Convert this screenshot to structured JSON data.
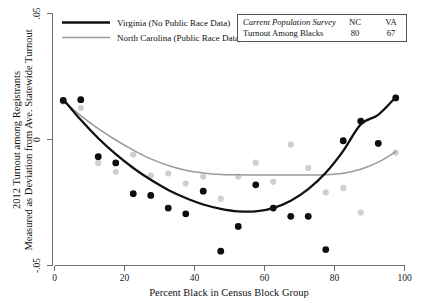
{
  "chart_data": {
    "type": "scatter",
    "title": "",
    "xlabel": "Percent Black in Census Block Group",
    "ylabel_line1": "2012 Turnout among Registrants",
    "ylabel_line2": "Measured as Deviation from Ave. Statewide Turnout",
    "xlim": [
      0,
      100
    ],
    "ylim": [
      -0.05,
      0.05
    ],
    "xticks": [
      0,
      20,
      40,
      60,
      80,
      100
    ],
    "xtick_labels": [
      "0",
      "20",
      "40",
      "60",
      "80",
      "100"
    ],
    "yticks": [
      0.05,
      0,
      -0.05
    ],
    "ytick_labels": [
      ".05",
      "0",
      "-.05"
    ],
    "grid": false,
    "legend_position": "top-left",
    "series": [
      {
        "name": "Virginia (No Public Race Data)",
        "color": "#111111",
        "marker_color": "#0d0d0d",
        "line_width": 2.3,
        "x": [
          2.5,
          7.5,
          12.5,
          17.5,
          22.5,
          27.5,
          32.5,
          37.5,
          42.5,
          47.5,
          52.5,
          57.5,
          62.5,
          67.5,
          72.5,
          77.5,
          82.5,
          87.5,
          92.5,
          97.5
        ],
        "y": [
          0.0155,
          0.0158,
          -0.0068,
          -0.0093,
          -0.0215,
          -0.0222,
          -0.0272,
          -0.0295,
          -0.0205,
          -0.0443,
          -0.0345,
          -0.018,
          -0.0272,
          -0.0305,
          -0.0305,
          -0.0437,
          -0.0005,
          0.0073,
          -0.0015,
          0.0165
        ],
        "fit_x": [
          2.5,
          7.5,
          12.5,
          17.5,
          22.5,
          27.5,
          32.5,
          37.5,
          42.5,
          47.5,
          52.5,
          57.5,
          62.5,
          67.5,
          72.5,
          77.5,
          82.5,
          87.5,
          92.5,
          97.5
        ],
        "fit_y": [
          0.016,
          0.0078,
          0.0005,
          -0.0058,
          -0.0113,
          -0.016,
          -0.02,
          -0.0232,
          -0.0258,
          -0.0275,
          -0.0285,
          -0.0285,
          -0.0272,
          -0.0243,
          -0.0197,
          -0.0132,
          -0.0045,
          0.006,
          0.0098,
          0.0168
        ]
      },
      {
        "name": "North Carolina (Public Race Data)",
        "color": "#9a9a9a",
        "marker_color": "#cfcfcf",
        "line_width": 1.5,
        "x": [
          2.5,
          7.5,
          12.5,
          17.5,
          22.5,
          27.5,
          32.5,
          37.5,
          42.5,
          47.5,
          52.5,
          57.5,
          62.5,
          67.5,
          72.5,
          77.5,
          82.5,
          87.5,
          92.5,
          97.5
        ],
        "y": [
          0.015,
          0.0125,
          -0.0093,
          -0.0128,
          -0.006,
          -0.0143,
          -0.0135,
          -0.0175,
          -0.0147,
          -0.0235,
          -0.0147,
          -0.0092,
          -0.0168,
          -0.002,
          -0.0113,
          -0.021,
          -0.0192,
          -0.029,
          -0.0018,
          -0.0052
        ],
        "fit_x": [
          2.5,
          7.5,
          12.5,
          17.5,
          22.5,
          27.5,
          32.5,
          37.5,
          42.5,
          47.5,
          52.5,
          57.5,
          62.5,
          67.5,
          72.5,
          77.5,
          82.5,
          87.5,
          92.5,
          97.5
        ],
        "fit_y": [
          0.0152,
          0.0095,
          0.0043,
          -0.0002,
          -0.0042,
          -0.0077,
          -0.0103,
          -0.0122,
          -0.0133,
          -0.0139,
          -0.014,
          -0.0141,
          -0.0141,
          -0.0141,
          -0.0141,
          -0.014,
          -0.0134,
          -0.0118,
          -0.009,
          -0.0048
        ]
      }
    ]
  },
  "legend": {
    "items": [
      {
        "label": "Virginia (No Public Race Data)",
        "color": "#111111",
        "width": 2.3
      },
      {
        "label": "North Carolina (Public Race Data)",
        "color": "#9a9a9a",
        "width": 1.5
      }
    ]
  },
  "info_table": {
    "header_label": "Current Population Survey",
    "columns": [
      "NC",
      "VA"
    ],
    "row_label": "Turnout Among Blacks",
    "values": [
      "80",
      "67"
    ]
  }
}
